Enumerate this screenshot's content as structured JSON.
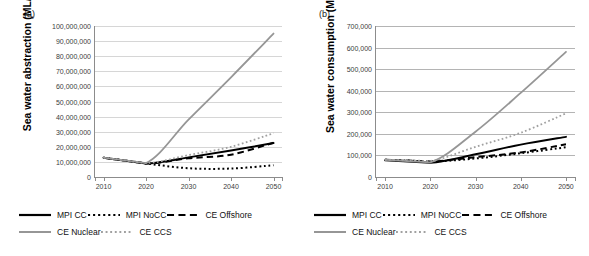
{
  "figure": {
    "panels": [
      {
        "key": "a",
        "label": "(a)",
        "ylabel": "Sea water abstraction (ML/yr)"
      },
      {
        "key": "b",
        "label": "(b)",
        "ylabel": "Sea water consumption (ML/yr)"
      }
    ],
    "legend": {
      "rows": [
        [
          {
            "name": "MPI CC",
            "style": "solid",
            "color": "#000000"
          },
          {
            "name": "MPI NoCC",
            "style": "dotted",
            "color": "#000000"
          },
          {
            "name": "CE Offshore",
            "style": "dashed",
            "color": "#000000"
          }
        ],
        [
          {
            "name": "CE Nuclear",
            "style": "solid",
            "color": "#969696"
          },
          {
            "name": "CE CCS",
            "style": "dotted",
            "color": "#a0a0a0"
          }
        ]
      ]
    }
  },
  "chart_data": [
    {
      "type": "line",
      "panel": "(a)",
      "title": "",
      "xlabel": "",
      "ylabel": "Sea water abstraction (ML/yr)",
      "x": [
        2010,
        2020,
        2030,
        2040,
        2050
      ],
      "xlim": [
        2008,
        2052
      ],
      "ylim": [
        0,
        100000000
      ],
      "xticks": [
        "2010",
        "2020",
        "2030",
        "2040",
        "2050"
      ],
      "yticks": [
        "0",
        "10,000,000",
        "20,000,000",
        "30,000,000",
        "40,000,000",
        "50,000,000",
        "60,000,000",
        "70,000,000",
        "80,000,000",
        "90,000,000",
        "100,000,000"
      ],
      "ytick_values": [
        0,
        10000000,
        20000000,
        30000000,
        40000000,
        50000000,
        60000000,
        70000000,
        80000000,
        90000000,
        100000000
      ],
      "grid": true,
      "legend_position": "below",
      "series": [
        {
          "name": "MPI CC",
          "style": "solid",
          "color": "#000000",
          "width": 2.0,
          "values": [
            12800000,
            9000000,
            13000000,
            17500000,
            22500000
          ]
        },
        {
          "name": "MPI NoCC",
          "style": "dotted",
          "color": "#000000",
          "width": 2.0,
          "values": [
            12800000,
            9000000,
            5800000,
            5600000,
            7800000
          ]
        },
        {
          "name": "CE Offshore",
          "style": "dashed",
          "color": "#000000",
          "width": 2.0,
          "values": [
            12800000,
            9000000,
            12400000,
            14800000,
            22700000
          ]
        },
        {
          "name": "CE Nuclear",
          "style": "solid",
          "color": "#969696",
          "width": 1.8,
          "values": [
            12900000,
            9200000,
            38000000,
            66000000,
            95000000
          ]
        },
        {
          "name": "CE CCS",
          "style": "dotted",
          "color": "#a0a0a0",
          "width": 1.8,
          "values": [
            12800000,
            9200000,
            14500000,
            20000000,
            29000000
          ]
        }
      ]
    },
    {
      "type": "line",
      "panel": "(b)",
      "title": "",
      "xlabel": "",
      "ylabel": "Sea water consumption (ML/yr)",
      "x": [
        2010,
        2020,
        2030,
        2040,
        2050
      ],
      "xlim": [
        2008,
        2052
      ],
      "ylim": [
        0,
        700000
      ],
      "xticks": [
        "2010",
        "2020",
        "2030",
        "2040",
        "2050"
      ],
      "yticks": [
        "0",
        "100,000",
        "200,000",
        "300,000",
        "400,000",
        "500,000",
        "600,000",
        "700,000"
      ],
      "ytick_values": [
        0,
        100000,
        200000,
        300000,
        400000,
        500000,
        600000,
        700000
      ],
      "grid": true,
      "legend_position": "below",
      "series": [
        {
          "name": "MPI CC",
          "style": "solid",
          "color": "#000000",
          "width": 2.0,
          "values": [
            78000,
            66000,
            105000,
            150000,
            186000
          ]
        },
        {
          "name": "MPI NoCC",
          "style": "dotted",
          "color": "#000000",
          "width": 2.0,
          "values": [
            80000,
            72000,
            86000,
            110000,
            138000
          ]
        },
        {
          "name": "CE Offshore",
          "style": "dashed",
          "color": "#000000",
          "width": 2.0,
          "values": [
            80000,
            72000,
            92000,
            114000,
            152000
          ]
        },
        {
          "name": "CE Nuclear",
          "style": "solid",
          "color": "#969696",
          "width": 1.8,
          "values": [
            80000,
            68000,
            210000,
            390000,
            580000
          ]
        },
        {
          "name": "CE CCS",
          "style": "dotted",
          "color": "#a0a0a0",
          "width": 1.8,
          "values": [
            80000,
            74000,
            140000,
            205000,
            295000
          ]
        }
      ]
    }
  ]
}
